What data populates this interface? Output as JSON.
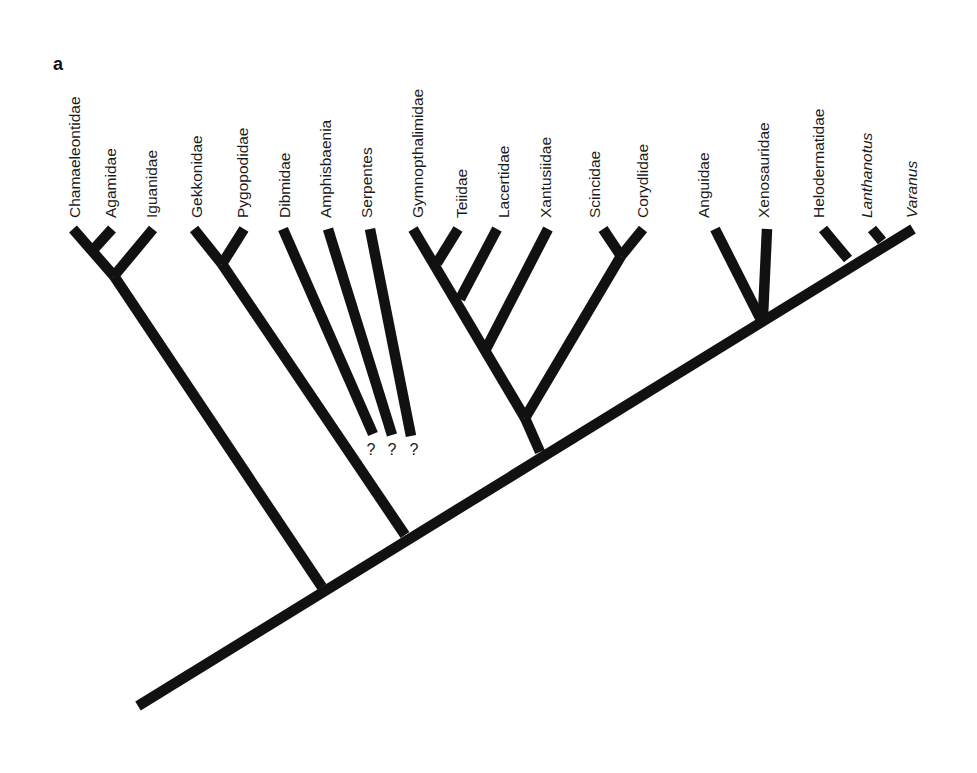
{
  "figure": {
    "panel_label": "a",
    "type": "phylogenetic-tree",
    "line_color": "#111111",
    "background": "#ffffff"
  },
  "taxa": [
    {
      "id": "chamaeleontidae",
      "label": "Chamaeleontidae",
      "italic": false,
      "tip": [
        73,
        229
      ],
      "label_x": 80
    },
    {
      "id": "agamidae",
      "label": "Agamidae",
      "italic": false,
      "tip": [
        112,
        229
      ],
      "label_x": 116
    },
    {
      "id": "iguanidae",
      "label": "Iguanidae",
      "italic": false,
      "tip": [
        153,
        229
      ],
      "label_x": 157
    },
    {
      "id": "gekkonidae",
      "label": "Gekkonidae",
      "italic": false,
      "tip": [
        194,
        229
      ],
      "label_x": 202
    },
    {
      "id": "pygopodidae",
      "label": "Pygopodidae",
      "italic": false,
      "tip": [
        244,
        229
      ],
      "label_x": 248
    },
    {
      "id": "dibmidae",
      "label": "Dibmidae",
      "italic": false,
      "tip": [
        283,
        229
      ],
      "label_x": 290
    },
    {
      "id": "amphisbaenia",
      "label": "Amphisbaenia",
      "italic": false,
      "tip": [
        328,
        229
      ],
      "label_x": 331
    },
    {
      "id": "serpentes",
      "label": "Serpentes",
      "italic": false,
      "tip": [
        370,
        229
      ],
      "label_x": 372
    },
    {
      "id": "gymnopthalimidae",
      "label": "Gymnopthalimidae",
      "italic": false,
      "tip": [
        413,
        229
      ],
      "label_x": 423
    },
    {
      "id": "teiidae",
      "label": "Teiidae",
      "italic": false,
      "tip": [
        458,
        229
      ],
      "label_x": 467
    },
    {
      "id": "lacertidae",
      "label": "Lacertidae",
      "italic": false,
      "tip": [
        497,
        229
      ],
      "label_x": 509
    },
    {
      "id": "xantusiidae",
      "label": "Xantusiidae",
      "italic": false,
      "tip": [
        548,
        229
      ],
      "label_x": 551
    },
    {
      "id": "scincidae",
      "label": "Scincidae",
      "italic": false,
      "tip": [
        603,
        229
      ],
      "label_x": 600
    },
    {
      "id": "corydlidae",
      "label": "Corydlidae",
      "italic": false,
      "tip": [
        643,
        229
      ],
      "label_x": 648
    },
    {
      "id": "anguidae",
      "label": "Anguidae",
      "italic": false,
      "tip": [
        715,
        229
      ],
      "label_x": 709
    },
    {
      "id": "xenosauridae",
      "label": "Xenosauridae",
      "italic": false,
      "tip": [
        767,
        229
      ],
      "label_x": 769
    },
    {
      "id": "helodermatidae",
      "label": "Helodermatidae",
      "italic": false,
      "tip": [
        823,
        229
      ],
      "label_x": 824
    },
    {
      "id": "lanthanotus",
      "label": "Lanthanotus",
      "italic": true,
      "tip": [
        872,
        229
      ],
      "label_x": 872
    },
    {
      "id": "varanus",
      "label": "Varanus",
      "italic": true,
      "tip": [
        913,
        229
      ],
      "label_x": 917
    }
  ],
  "uncertain_markers": [
    {
      "label": "?",
      "x": 371,
      "y": 455
    },
    {
      "label": "?",
      "x": 392,
      "y": 455
    },
    {
      "label": "?",
      "x": 414,
      "y": 455
    }
  ],
  "branches": [
    {
      "name": "backbone",
      "from": [
        138,
        706
      ],
      "to": [
        913,
        229
      ]
    },
    {
      "name": "iguania-stem",
      "from": [
        322,
        587
      ],
      "to": [
        114,
        276
      ]
    },
    {
      "name": "chamaeleontidae-branch",
      "from": [
        114,
        276
      ],
      "to": [
        73,
        229
      ]
    },
    {
      "name": "agamidae-branch",
      "from": [
        93,
        250
      ],
      "to": [
        112,
        229
      ]
    },
    {
      "name": "iguanidae-branch",
      "from": [
        114,
        276
      ],
      "to": [
        153,
        229
      ]
    },
    {
      "name": "gekkota-stem",
      "from": [
        405,
        535
      ],
      "to": [
        222,
        264
      ]
    },
    {
      "name": "gekkonidae-branch",
      "from": [
        222,
        264
      ],
      "to": [
        194,
        229
      ]
    },
    {
      "name": "pygopodidae-branch",
      "from": [
        222,
        264
      ],
      "to": [
        244,
        229
      ]
    },
    {
      "name": "dibmidae-branch",
      "from": [
        373,
        434
      ],
      "to": [
        283,
        229
      ]
    },
    {
      "name": "amphisbaenia-branch",
      "from": [
        392,
        435
      ],
      "to": [
        328,
        229
      ]
    },
    {
      "name": "serpentes-branch",
      "from": [
        411,
        436
      ],
      "to": [
        370,
        229
      ]
    },
    {
      "name": "scincoidea-stem",
      "from": [
        540,
        452
      ],
      "to": [
        525,
        418
      ]
    },
    {
      "name": "lacertoidea-stem",
      "from": [
        525,
        418
      ],
      "to": [
        413,
        229
      ]
    },
    {
      "name": "teiidae-branch",
      "from": [
        437,
        263
      ],
      "to": [
        458,
        229
      ]
    },
    {
      "name": "lacertidae-branch",
      "from": [
        460,
        299
      ],
      "to": [
        497,
        229
      ]
    },
    {
      "name": "xantusiidae-branch",
      "from": [
        486,
        349
      ],
      "to": [
        548,
        229
      ]
    },
    {
      "name": "scincid-cordylid-stem",
      "from": [
        525,
        418
      ],
      "to": [
        621,
        256
      ]
    },
    {
      "name": "scincidae-branch",
      "from": [
        621,
        256
      ],
      "to": [
        603,
        229
      ]
    },
    {
      "name": "corydlidae-branch",
      "from": [
        621,
        256
      ],
      "to": [
        643,
        229
      ]
    },
    {
      "name": "anguidae-branch",
      "from": [
        760,
        318
      ],
      "to": [
        715,
        229
      ]
    },
    {
      "name": "xenosauridae-branch",
      "from": [
        763,
        316
      ],
      "to": [
        767,
        229
      ]
    },
    {
      "name": "helodermatidae-branch",
      "from": [
        848,
        259
      ],
      "to": [
        823,
        229
      ]
    },
    {
      "name": "lanthanotus-branch",
      "from": [
        882,
        241
      ],
      "to": [
        872,
        229
      ]
    }
  ],
  "label_baseline_y": 218
}
